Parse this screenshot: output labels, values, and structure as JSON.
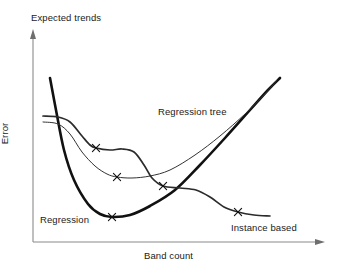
{
  "chart_data": {
    "type": "line",
    "title": "Expected trends",
    "xlabel": "Band count",
    "ylabel": "Error",
    "grid": false,
    "legend_position": "inline-annotations",
    "axes": {
      "x_arrow": true,
      "y_arrow": true,
      "x_ticks": [],
      "y_ticks": [],
      "x_range_qualitative": [
        "low band count",
        "high band count"
      ],
      "y_range_qualitative": [
        "low error",
        "high error"
      ]
    },
    "series": [
      {
        "name": "Regression",
        "label": "Regression",
        "stroke": "#111111",
        "width": 2.6,
        "shape": "u-shaped convex curve: very high error at low band count, sharp decline to a minimum, then steep rise at high band count",
        "points": [
          {
            "x": 50,
            "y": 78
          },
          {
            "x": 56,
            "y": 110
          },
          {
            "x": 64,
            "y": 150
          },
          {
            "x": 74,
            "y": 180
          },
          {
            "x": 88,
            "y": 204
          },
          {
            "x": 100,
            "y": 214
          },
          {
            "x": 112,
            "y": 217
          },
          {
            "x": 130,
            "y": 215
          },
          {
            "x": 150,
            "y": 206
          },
          {
            "x": 175,
            "y": 190
          },
          {
            "x": 200,
            "y": 165
          },
          {
            "x": 225,
            "y": 138
          },
          {
            "x": 250,
            "y": 110
          },
          {
            "x": 268,
            "y": 90
          },
          {
            "x": 280,
            "y": 78
          }
        ],
        "markers": [
          {
            "x": 112,
            "y": 217,
            "glyph": "x"
          }
        ]
      },
      {
        "name": "Regression tree",
        "label": "Regression tree",
        "stroke": "#333333",
        "width": 1.0,
        "shape": "gradual decline from moderate error to a shallow minimum, then steady rise at high band count",
        "points": [
          {
            "x": 43,
            "y": 122
          },
          {
            "x": 58,
            "y": 124
          },
          {
            "x": 70,
            "y": 134
          },
          {
            "x": 82,
            "y": 152
          },
          {
            "x": 95,
            "y": 166
          },
          {
            "x": 107,
            "y": 174
          },
          {
            "x": 117,
            "y": 177
          },
          {
            "x": 132,
            "y": 178
          },
          {
            "x": 150,
            "y": 176
          },
          {
            "x": 170,
            "y": 170
          },
          {
            "x": 195,
            "y": 155
          },
          {
            "x": 220,
            "y": 136
          },
          {
            "x": 245,
            "y": 114
          },
          {
            "x": 265,
            "y": 94
          },
          {
            "x": 277,
            "y": 80
          }
        ],
        "markers": [
          {
            "x": 117,
            "y": 177,
            "glyph": "x"
          }
        ]
      },
      {
        "name": "Instance based",
        "label": "Instance based",
        "stroke": "#2b2b2b",
        "width": 1.7,
        "shape": "stepwise decline: plateau, drop, second plateau, drop, final low plateau — error keeps decreasing as band count grows",
        "points": [
          {
            "x": 43,
            "y": 116
          },
          {
            "x": 58,
            "y": 117
          },
          {
            "x": 70,
            "y": 122
          },
          {
            "x": 82,
            "y": 136
          },
          {
            "x": 90,
            "y": 145
          },
          {
            "x": 96,
            "y": 148
          },
          {
            "x": 110,
            "y": 150
          },
          {
            "x": 122,
            "y": 149
          },
          {
            "x": 134,
            "y": 152
          },
          {
            "x": 144,
            "y": 165
          },
          {
            "x": 152,
            "y": 178
          },
          {
            "x": 163,
            "y": 186
          },
          {
            "x": 180,
            "y": 188
          },
          {
            "x": 196,
            "y": 190
          },
          {
            "x": 210,
            "y": 197
          },
          {
            "x": 224,
            "y": 207
          },
          {
            "x": 238,
            "y": 212
          },
          {
            "x": 254,
            "y": 215
          },
          {
            "x": 270,
            "y": 216
          }
        ],
        "markers": [
          {
            "x": 96,
            "y": 148,
            "glyph": "x"
          },
          {
            "x": 163,
            "y": 186,
            "glyph": "x"
          },
          {
            "x": 238,
            "y": 212,
            "glyph": "x"
          }
        ]
      }
    ]
  },
  "colors": {
    "axis": "#8a8a8a",
    "text": "#1a1a1a",
    "background": "#ffffff"
  }
}
